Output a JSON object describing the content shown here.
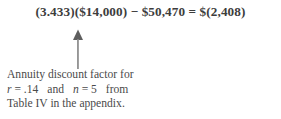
{
  "equation": {
    "text": "(3.433)($14,000) − $50,470 = $(2,408)"
  },
  "annotation": {
    "arrow": "up-arrow-icon",
    "lines": [
      "Annuity discount factor for",
      "Table IV in the appendix."
    ],
    "middle_line": {
      "var_rate": "r",
      "eq1": "= .14",
      "conjunction": "and",
      "var_periods": "n",
      "eq2": "= 5",
      "tail": "from"
    }
  },
  "colors": {
    "background": "#ffffff",
    "text": "#3f3f3f",
    "equation_text": "#3d3d3d",
    "arrow": "#6e6e6e"
  }
}
